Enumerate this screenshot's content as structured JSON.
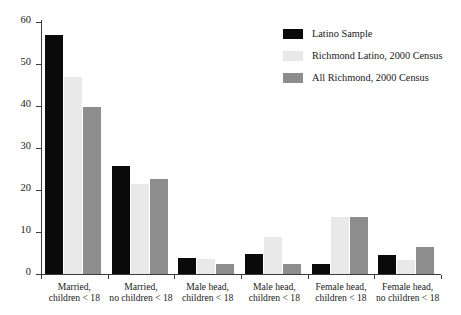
{
  "chart_data": {
    "type": "bar",
    "title": "",
    "xlabel": "",
    "ylabel": "",
    "ylim": [
      0,
      60
    ],
    "yticks": [
      0,
      10,
      20,
      30,
      40,
      50,
      60
    ],
    "grid": false,
    "legend_position": "top-right",
    "categories": [
      "Married,\nchildren < 18",
      "Married,\nno children < 18",
      "Male head,\nchildren < 18",
      "Male head,\nchildren < 18",
      "Female head,\nchildren < 18",
      "Female head,\nno children < 18"
    ],
    "category_lines": [
      [
        "Married,",
        "children < 18"
      ],
      [
        "Married,",
        "no children < 18"
      ],
      [
        "Male head,",
        "children < 18"
      ],
      [
        "Male head,",
        "children < 18"
      ],
      [
        "Female head,",
        "children < 18"
      ],
      [
        "Female head,",
        "no children < 18"
      ]
    ],
    "series": [
      {
        "name": "Latino Sample",
        "color": "#0a0a0a",
        "values": [
          56.8,
          25.8,
          3.7,
          4.7,
          2.5,
          4.6
        ]
      },
      {
        "name": "Richmond Latino, 2000 Census",
        "color": "#e9e9e9",
        "values": [
          46.9,
          21.5,
          3.6,
          8.7,
          13.5,
          3.4
        ]
      },
      {
        "name": "All Richmond, 2000 Census",
        "color": "#8d8d8d",
        "values": [
          39.8,
          22.7,
          2.5,
          2.5,
          13.6,
          6.4
        ]
      }
    ]
  },
  "legend": {
    "items": [
      {
        "label": "Latino Sample"
      },
      {
        "label": "Richmond Latino, 2000 Census"
      },
      {
        "label": "All Richmond, 2000 Census"
      }
    ]
  },
  "axis": {
    "y_tick_labels": [
      "0",
      "10",
      "20",
      "30",
      "40",
      "50",
      "60"
    ]
  }
}
